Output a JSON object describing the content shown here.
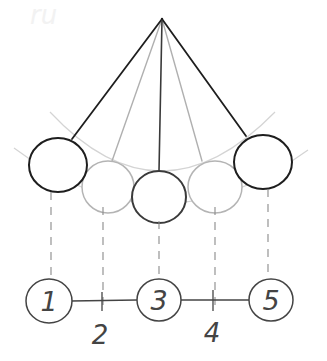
{
  "diagram": {
    "colors": {
      "dark": "#1e1e1e",
      "light": "#b4b4b4",
      "guide": "#d2d2d2",
      "dash": "#8a8a8a",
      "background": "#ffffff"
    },
    "pivot": {
      "x": 162,
      "y": 19
    },
    "balls": [
      {
        "id": 1,
        "cx": 58,
        "cy": 165,
        "rx": 29,
        "ry": 27,
        "style": "dark",
        "attach_x": 72,
        "attach_y": 139
      },
      {
        "id": 2,
        "cx": 108,
        "cy": 187,
        "rx": 26,
        "ry": 26,
        "style": "light",
        "attach_x": 112,
        "attach_y": 161
      },
      {
        "id": 3,
        "cx": 159,
        "cy": 197,
        "rx": 27,
        "ry": 26,
        "style": "dark",
        "attach_x": 159,
        "attach_y": 171
      },
      {
        "id": 4,
        "cx": 215,
        "cy": 187,
        "rx": 27,
        "ry": 26,
        "style": "light",
        "attach_x": 202,
        "attach_y": 161
      },
      {
        "id": 5,
        "cx": 263,
        "cy": 162,
        "rx": 29,
        "ry": 27,
        "style": "dark",
        "attach_x": 246,
        "attach_y": 136
      }
    ],
    "number_line": {
      "y": 301,
      "points": [
        {
          "value": "1",
          "x": 49,
          "circled": true
        },
        {
          "value": "2",
          "x": 102,
          "circled": false
        },
        {
          "value": "3",
          "x": 159,
          "circled": true
        },
        {
          "value": "4",
          "x": 213,
          "circled": false
        },
        {
          "value": "5",
          "x": 271,
          "circled": true
        }
      ],
      "labels": {
        "p1": "1",
        "p2": "2",
        "p3": "3",
        "p4": "4",
        "p5": "5"
      }
    },
    "watermark": "ru"
  }
}
